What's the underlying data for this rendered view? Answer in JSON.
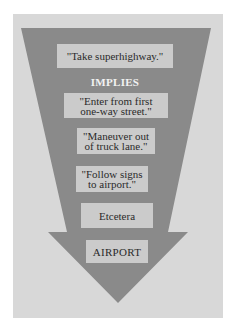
{
  "diagram": {
    "type": "funnel-arrow",
    "colors": {
      "background": "#ffffff",
      "panel": "#d8d8d8",
      "arrow": "#8a8a8a",
      "box": "#cbcbcb",
      "text": "#2a2a2a",
      "connector_text": "#f2f2f2"
    },
    "top_goal": "\"Take superhighway.\"",
    "connector": "IMPLIES",
    "steps": [
      {
        "line1": "\"Enter from first",
        "line2": "one-way street.\""
      },
      {
        "line1": "\"Maneuver out",
        "line2": "of truck lane.\""
      },
      {
        "line1": "\"Follow signs",
        "line2": "to airport.\""
      }
    ],
    "etc": "Etcetera",
    "destination": "AIRPORT"
  }
}
